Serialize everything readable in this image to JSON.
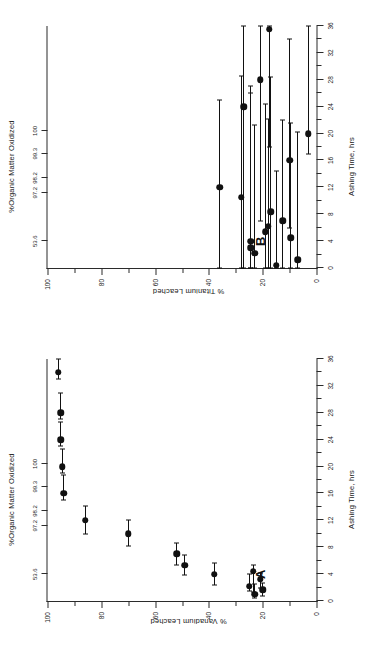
{
  "figure": {
    "orientation_note": "rotated",
    "panels": [
      {
        "letter": "A",
        "xlabel": "Ashing Time, hrs",
        "ylabel": "% Vanadium Leached",
        "toplabel": "%Organic Matter Oxidized",
        "xlim": [
          0,
          36
        ],
        "ylim": [
          0,
          100
        ],
        "xticks": [
          0,
          4,
          8,
          12,
          16,
          20,
          24,
          28,
          32,
          36
        ],
        "yticks": [
          0,
          20,
          40,
          60,
          80,
          100
        ],
        "top_ticks": [
          {
            "x": 4,
            "label": "53.6"
          },
          {
            "x": 11.2,
            "label": "97.2"
          },
          {
            "x": 13.4,
            "label": "98.2"
          },
          {
            "x": 17.0,
            "label": "99.3"
          },
          {
            "x": 20.4,
            "label": "100"
          }
        ]
      },
      {
        "letter": "B",
        "xlabel": "Ashing Time, hrs",
        "ylabel": "% Titanium Leached",
        "toplabel": "%Organic Matter Oxidized",
        "xlim": [
          0,
          36
        ],
        "ylim": [
          0,
          100
        ],
        "xticks": [
          0,
          4,
          8,
          12,
          16,
          20,
          24,
          28,
          32,
          36
        ],
        "yticks": [
          0,
          20,
          40,
          60,
          80,
          100
        ],
        "top_ticks": [
          {
            "x": 4,
            "label": "53.6"
          },
          {
            "x": 11.2,
            "label": "97.2"
          },
          {
            "x": 13.4,
            "label": "98.2"
          },
          {
            "x": 17.0,
            "label": "99.3"
          },
          {
            "x": 20.4,
            "label": "100"
          }
        ]
      }
    ]
  },
  "chart_data": [
    {
      "type": "scatter",
      "panel": "A",
      "title": "",
      "xlabel": "Ashing Time, hrs",
      "ylabel": "% Vanadium Leached",
      "secondary_xlabel": "%Organic Matter Oxidized",
      "xlim": [
        0,
        36
      ],
      "ylim": [
        0,
        100
      ],
      "xticks": [
        0,
        4,
        8,
        12,
        16,
        20,
        24,
        28,
        32,
        36
      ],
      "yticks": [
        0,
        20,
        40,
        60,
        80,
        100
      ],
      "grid": false,
      "legend": "none",
      "errorbars": "x",
      "points": [
        {
          "x": 1.0,
          "y": 23.0,
          "xerr_low": 0.6,
          "xerr_high": 1.6
        },
        {
          "x": 1.7,
          "y": 20.0,
          "xerr_low": 0.9,
          "xerr_high": 1.0
        },
        {
          "x": 2.2,
          "y": 25.0,
          "xerr_low": 0.7,
          "xerr_high": 1.8
        },
        {
          "x": 3.2,
          "y": 21.0,
          "xerr_low": 1.2,
          "xerr_high": 1.0
        },
        {
          "x": 4.0,
          "y": 38.0,
          "xerr_low": 1.6,
          "xerr_high": 1.7
        },
        {
          "x": 4.4,
          "y": 23.5,
          "xerr_low": 3.0,
          "xerr_high": 1.0
        },
        {
          "x": 5.3,
          "y": 49.0,
          "xerr_low": 1.5,
          "xerr_high": 1.5
        },
        {
          "x": 7.0,
          "y": 52.0,
          "xerr_low": 1.6,
          "xerr_high": 1.6
        },
        {
          "x": 10.0,
          "y": 70.0,
          "xerr_low": 1.8,
          "xerr_high": 2.0
        },
        {
          "x": 12.0,
          "y": 86.0,
          "xerr_low": 2.0,
          "xerr_high": 2.2
        },
        {
          "x": 16.0,
          "y": 94.0,
          "xerr_low": 1.0,
          "xerr_high": 2.8
        },
        {
          "x": 20.0,
          "y": 94.5,
          "xerr_low": 1.0,
          "xerr_high": 2.6
        },
        {
          "x": 24.0,
          "y": 95.0,
          "xerr_low": 1.0,
          "xerr_high": 2.6
        },
        {
          "x": 28.0,
          "y": 95.0,
          "xerr_low": 1.0,
          "xerr_high": 3.0
        },
        {
          "x": 34.0,
          "y": 96.0,
          "xerr_low": 1.0,
          "xerr_high": 2.5
        }
      ]
    },
    {
      "type": "scatter",
      "panel": "B",
      "title": "",
      "xlabel": "Ashing Time, hrs",
      "ylabel": "% Titanium Leached",
      "secondary_xlabel": "%Organic Matter Oxidized",
      "xlim": [
        0,
        36
      ],
      "ylim": [
        0,
        100
      ],
      "xticks": [
        0,
        4,
        8,
        12,
        16,
        20,
        24,
        28,
        32,
        36
      ],
      "yticks": [
        0,
        20,
        40,
        60,
        80,
        100
      ],
      "grid": false,
      "legend": "none",
      "errorbars": "x",
      "points": [
        {
          "x": 0.4,
          "y": 15.0,
          "xerr_low": 0.4,
          "xerr_high": 14.0
        },
        {
          "x": 1.2,
          "y": 7.0,
          "xerr_low": 1.2,
          "xerr_high": 19.0
        },
        {
          "x": 2.2,
          "y": 23.0,
          "xerr_low": 2.2,
          "xerr_high": 19.0
        },
        {
          "x": 3.0,
          "y": 24.5,
          "xerr_low": 3.0,
          "xerr_high": 24.0
        },
        {
          "x": 4.0,
          "y": 24.5,
          "xerr_low": 4.0,
          "xerr_high": 22.0
        },
        {
          "x": 4.5,
          "y": 9.5,
          "xerr_low": 4.5,
          "xerr_high": 17.0
        },
        {
          "x": 5.4,
          "y": 19.0,
          "xerr_low": 5.4,
          "xerr_high": 19.0
        },
        {
          "x": 6.2,
          "y": 18.0,
          "xerr_low": 6.2,
          "xerr_high": 16.0
        },
        {
          "x": 7.0,
          "y": 12.5,
          "xerr_low": 7.0,
          "xerr_high": 15.0
        },
        {
          "x": 8.4,
          "y": 17.0,
          "xerr_low": 8.4,
          "xerr_high": 20.0
        },
        {
          "x": 10.5,
          "y": 28.0,
          "xerr_low": 10.5,
          "xerr_high": 18.0
        },
        {
          "x": 12.0,
          "y": 36.0,
          "xerr_low": 12.0,
          "xerr_high": 13.0
        },
        {
          "x": 16.0,
          "y": 10.0,
          "xerr_low": 10.0,
          "xerr_high": 18.0
        },
        {
          "x": 20.0,
          "y": 3.0,
          "xerr_low": 3.0,
          "xerr_high": 30.0
        },
        {
          "x": 24.0,
          "y": 27.0,
          "xerr_low": 27.0,
          "xerr_high": 14.0
        },
        {
          "x": 28.0,
          "y": 21.0,
          "xerr_low": 21.0,
          "xerr_high": 22.0
        },
        {
          "x": 35.5,
          "y": 17.5,
          "xerr_low": 17.5,
          "xerr_high": 20.0
        }
      ]
    }
  ]
}
